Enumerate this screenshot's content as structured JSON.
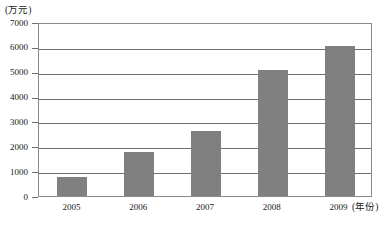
{
  "chart_data": {
    "type": "bar",
    "title": "",
    "subtitle": "",
    "categories": [
      "2005",
      "2006",
      "2007",
      "2008",
      "2009"
    ],
    "values": [
      780,
      1780,
      2600,
      5050,
      6050
    ],
    "xlabel": "(年份)",
    "ylabel": "(万元)",
    "ylim": [
      0,
      7000
    ],
    "ytick_labels": [
      "0",
      "1000",
      "2000",
      "3000",
      "4000",
      "5000",
      "6000",
      "7000"
    ],
    "ytick_values": [
      0,
      1000,
      2000,
      3000,
      4000,
      5000,
      6000,
      7000
    ],
    "ytick_interval": 1000,
    "grid": true,
    "grid_axis": "y",
    "legend": false,
    "legend_position": "none",
    "series": [
      {
        "name": "",
        "values": [
          780,
          1780,
          2600,
          5050,
          6050
        ]
      }
    ],
    "colors": {
      "bar_fill": "#808080",
      "gridline": "#6f6f6f",
      "axis": "#8a8a8a",
      "plot_background": "#ffffff",
      "text": "#171717"
    }
  }
}
